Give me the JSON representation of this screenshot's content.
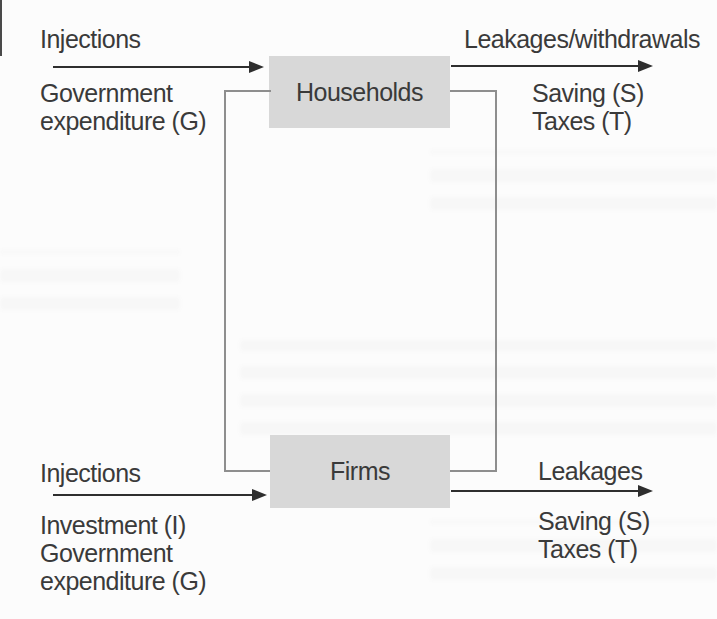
{
  "page": {
    "type": "scanned-textbook-diagram",
    "colors": {
      "background": "#fcfcfc",
      "box_fill": "#d8d8d8",
      "connector_line": "#8e8e8e",
      "arrow": "#2e2e2e",
      "text": "#3a3a3a"
    }
  },
  "flow": {
    "top": {
      "injections_label": "Injections",
      "injections_items": [
        "Government",
        "expenditure (G)"
      ],
      "box_label": "Households",
      "leakages_label": "Leakages/withdrawals",
      "leakages_items": [
        "Saving (S)",
        "Taxes (T)"
      ]
    },
    "bottom": {
      "injections_label": "Injections",
      "injections_items": [
        "Investment (I)",
        "Government",
        "expenditure (G)"
      ],
      "box_label": "Firms",
      "leakages_label": "Leakages",
      "leakages_items": [
        "Saving (S)",
        "Taxes (T)"
      ]
    }
  }
}
